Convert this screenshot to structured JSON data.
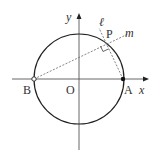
{
  "diagram": {
    "type": "geometry-unit-circle",
    "labels": {
      "x_axis": "x",
      "y_axis": "y",
      "origin": "O",
      "point_a": "A",
      "point_b": "B",
      "point_p": "P",
      "line_l": "ℓ",
      "line_m": "m"
    },
    "colors": {
      "stroke": "#222222",
      "dashed": "#555555",
      "text": "#333333"
    }
  }
}
